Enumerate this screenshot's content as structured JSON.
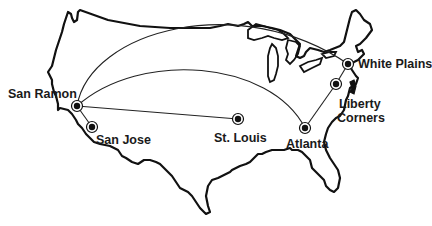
{
  "map": {
    "title": "US network sites",
    "colors": {
      "outline": "#111111",
      "background": "#ffffff"
    },
    "sites": [
      {
        "id": "san-ramon",
        "label": "San Ramon",
        "x": 77,
        "y": 106
      },
      {
        "id": "san-jose",
        "label": "San Jose",
        "x": 92,
        "y": 127
      },
      {
        "id": "st-louis",
        "label": "St. Louis",
        "x": 238,
        "y": 119
      },
      {
        "id": "atlanta",
        "label": "Atlanta",
        "x": 305,
        "y": 128
      },
      {
        "id": "white-plains",
        "label": "White Plains",
        "x": 348,
        "y": 64
      },
      {
        "id": "liberty-corners",
        "label": "Liberty Corners",
        "label_line1": "Liberty",
        "label_line2": "Corners",
        "x": 336,
        "y": 84
      }
    ],
    "links": [
      {
        "from": "San Ramon",
        "to": "White Plains",
        "style": "arc"
      },
      {
        "from": "San Ramon",
        "to": "Atlanta",
        "style": "arc"
      },
      {
        "from": "San Ramon",
        "to": "St. Louis",
        "style": "straight"
      },
      {
        "from": "San Ramon",
        "to": "San Jose",
        "style": "straight"
      },
      {
        "from": "Atlanta",
        "to": "Liberty Corners",
        "style": "straight"
      },
      {
        "from": "Liberty Corners",
        "to": "White Plains",
        "style": "straight"
      }
    ]
  }
}
